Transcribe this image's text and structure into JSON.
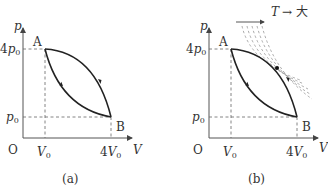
{
  "panels": [
    {
      "id": "a",
      "caption": "(a)",
      "axes": {
        "y_label": "p",
        "x_label": "V",
        "origin": "O"
      },
      "ticks": {
        "x": [
          "V0",
          "4V0"
        ],
        "y": [
          "p0",
          "4p0"
        ]
      },
      "points": {
        "A": "A",
        "B": "B"
      },
      "cycle": "A → B along upper curve, B → A along lower curve",
      "isotherms": false
    },
    {
      "id": "b",
      "caption": "(b)",
      "axes": {
        "y_label": "p",
        "x_label": "V",
        "origin": "O"
      },
      "ticks": {
        "x": [
          "V0",
          "4V0"
        ],
        "y": [
          "p0",
          "4p0"
        ]
      },
      "points": {
        "A": "A",
        "B": "B"
      },
      "cycle": "A → B along upper curve, B → A along lower curve",
      "isotherms": true,
      "temperature_note": "T → 大"
    }
  ],
  "labels": {
    "p": "p",
    "V": "V",
    "O": "O",
    "A": "A",
    "B": "B",
    "p0_base": "p",
    "p0_sub": "0",
    "fourp0_coef": "4",
    "V0_base": "V",
    "V0_sub": "0",
    "fourV0_coef": "4",
    "cap_a": "(a)",
    "cap_b": "(b)",
    "T": "T",
    "arrow_text": "→ 大"
  }
}
